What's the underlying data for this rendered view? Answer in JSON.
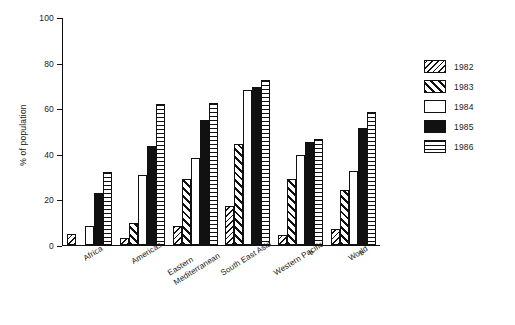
{
  "chart_data": {
    "type": "bar",
    "title": "",
    "subtitle": "",
    "xlabel": "",
    "ylabel": "% of population",
    "ylim": [
      0,
      100
    ],
    "yticks": [
      0,
      20,
      40,
      60,
      80,
      100
    ],
    "ytick_labels": [
      "0",
      "20",
      "40",
      "60",
      "80",
      "100"
    ],
    "grid": false,
    "legend_position": "right",
    "categories": [
      "Africa",
      "Americas",
      "Eastern Mediterranean",
      "South East Asia",
      "Western Pacific a",
      "World a"
    ],
    "category_labels": [
      {
        "text": "Africa",
        "footnote": ""
      },
      {
        "text": "Americas",
        "footnote": ""
      },
      {
        "text": "Eastern Mediterranean",
        "footnote": ""
      },
      {
        "text": "South East Asia",
        "footnote": ""
      },
      {
        "text": "Western Pacific",
        "footnote": "a"
      },
      {
        "text": "World",
        "footnote": "a"
      }
    ],
    "series": [
      {
        "name": "1982",
        "pattern": "back-diagonal-hatch",
        "values": [
          5,
          3,
          8.5,
          17,
          4.5,
          7
        ]
      },
      {
        "name": "1983",
        "pattern": "forward-diagonal-hatch",
        "values": [
          0,
          9.5,
          29,
          44.5,
          29,
          24
        ]
      },
      {
        "name": "1984",
        "pattern": "white-open",
        "values": [
          8.5,
          30.5,
          38,
          68,
          39.5,
          32.5
        ]
      },
      {
        "name": "1985",
        "pattern": "solid-black",
        "values": [
          23,
          43.5,
          55,
          69.5,
          45,
          51.5
        ]
      },
      {
        "name": "1986",
        "pattern": "horizontal-lines",
        "values": [
          32,
          62,
          62.5,
          72.5,
          46.5,
          58.5
        ]
      }
    ],
    "legend_entries": [
      "1982",
      "1983",
      "1984",
      "1985",
      "1986"
    ],
    "footnotes": [
      "a"
    ]
  }
}
